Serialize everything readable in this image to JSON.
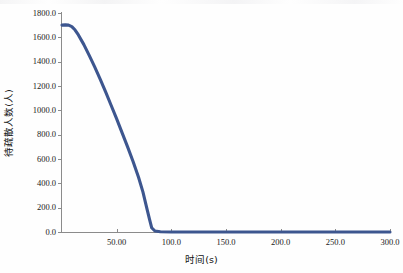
{
  "chart_data": {
    "type": "line",
    "title": "",
    "xlabel": "时间(s)",
    "ylabel": "待疏散人数(人)",
    "xlim": [
      0,
      300
    ],
    "ylim": [
      0,
      1800
    ],
    "grid": false,
    "legend": null,
    "series": [
      {
        "name": "待疏散人数",
        "color": "#3d568f",
        "x": [
          0,
          3,
          6,
          9,
          12,
          15,
          20,
          25,
          30,
          35,
          40,
          45,
          50,
          55,
          60,
          65,
          70,
          74,
          78,
          80,
          82,
          85,
          90,
          100,
          120,
          150,
          180,
          210,
          240,
          270,
          300
        ],
        "y": [
          1700,
          1702,
          1700,
          1688,
          1660,
          1620,
          1540,
          1450,
          1355,
          1255,
          1150,
          1040,
          930,
          815,
          700,
          580,
          450,
          330,
          180,
          105,
          35,
          8,
          2,
          0,
          0,
          0,
          0,
          0,
          0,
          0,
          0
        ]
      }
    ],
    "x_ticks": [
      {
        "value": 50,
        "label": "50.00"
      },
      {
        "value": 100,
        "label": "100.0"
      },
      {
        "value": 150,
        "label": "150.0"
      },
      {
        "value": 200,
        "label": "200.0"
      },
      {
        "value": 250,
        "label": "250.0"
      },
      {
        "value": 300,
        "label": "300.0"
      }
    ],
    "y_ticks": [
      {
        "value": 0,
        "label": "0.0"
      },
      {
        "value": 200,
        "label": "200.0"
      },
      {
        "value": 400,
        "label": "400.0"
      },
      {
        "value": 600,
        "label": "600.0"
      },
      {
        "value": 800,
        "label": "800.0"
      },
      {
        "value": 1000,
        "label": "1000.0"
      },
      {
        "value": 1200,
        "label": "1200.0"
      },
      {
        "value": 1400,
        "label": "1400.0"
      },
      {
        "value": 1600,
        "label": "1600.0"
      },
      {
        "value": 1800,
        "label": "1800.0"
      }
    ],
    "annotations": {
      "peak_value": 1700,
      "evacuation_complete_time": 82
    }
  },
  "colors": {
    "line": "#3d568f",
    "axis": "#8b8b8b",
    "text": "#1a1a1a",
    "background": "#fefefe"
  }
}
